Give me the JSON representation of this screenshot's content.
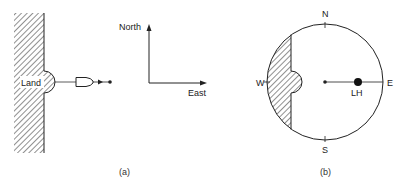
{
  "panel_a": {
    "land_label": "Land",
    "caption": "(a)",
    "compass": {
      "north_label": "North",
      "east_label": "East"
    }
  },
  "panel_b": {
    "caption": "(b)",
    "directions": {
      "north": "N",
      "south": "S",
      "east": "E",
      "west": "W"
    },
    "lighthouse_label": "LH"
  },
  "colors": {
    "stroke": "#222222",
    "hatch": "#444444",
    "background": "#ffffff"
  }
}
